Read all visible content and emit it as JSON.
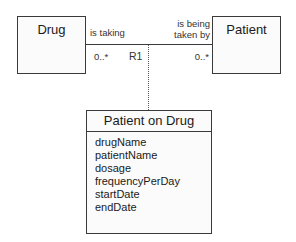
{
  "classes": {
    "drug": {
      "name": "Drug"
    },
    "patient": {
      "name": "Patient"
    },
    "association_class": {
      "name": "Patient on Drug",
      "attributes": [
        "drugName",
        "patientName",
        "dosage",
        "frequencyPerDay",
        "startDate",
        "endDate"
      ]
    }
  },
  "association": {
    "id": "R1",
    "left_phrase": "is taking",
    "right_phrase_line1": "is being",
    "right_phrase_line2": "taken by",
    "left_multiplicity": "0..*",
    "right_multiplicity": "0..*"
  }
}
